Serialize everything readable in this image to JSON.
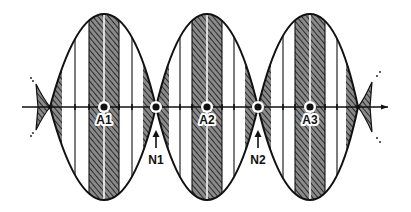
{
  "diagram": {
    "colors": {
      "ink": "#111111",
      "hatch_fill": "#6b6b6b",
      "background": "#ffffff"
    },
    "axis": {
      "y": 107,
      "x_start": 22,
      "x_end": 388
    },
    "envelope": {
      "top": 14,
      "bottom": 200
    },
    "nodes": [
      {
        "id": "end-left",
        "x": 50,
        "label": ""
      },
      {
        "id": "N1",
        "x": 156,
        "label": "N1"
      },
      {
        "id": "N2",
        "x": 258,
        "label": "N2"
      },
      {
        "id": "end-right",
        "x": 358,
        "label": ""
      }
    ],
    "antinodes": [
      {
        "id": "A1",
        "x": 104,
        "label": "A1"
      },
      {
        "id": "A2",
        "x": 207,
        "label": "A2"
      },
      {
        "id": "A3",
        "x": 310,
        "label": "A3"
      }
    ],
    "labels": {
      "a1": "A1",
      "a2": "A2",
      "a3": "A3",
      "n1": "N1",
      "n2": "N2"
    }
  }
}
